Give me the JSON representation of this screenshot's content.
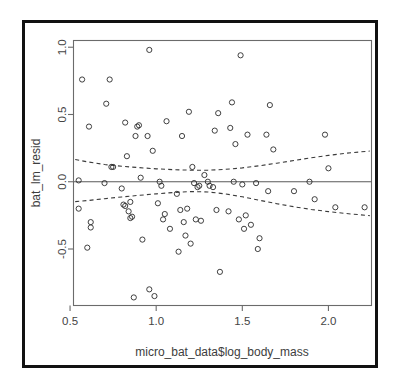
{
  "figure": {
    "border_color": "#111111",
    "background": "#ffffff",
    "axis_color": "#6b6b6b",
    "point_color": "#2b2b2b",
    "band_color": "#3a3a3a"
  },
  "chart_data": {
    "type": "scatter",
    "title": "",
    "xlabel": "micro_bat_data$log_body_mass",
    "ylabel": "bat_lm_resid",
    "xlim": [
      0.52,
      2.25
    ],
    "ylim": [
      -0.92,
      1.05
    ],
    "xticks": [
      0.5,
      1.0,
      1.5,
      2.0
    ],
    "xtick_labels": [
      "0.5",
      "1.0",
      "1.5",
      "2.0"
    ],
    "yticks": [
      -0.5,
      0.0,
      0.5,
      1.0
    ],
    "ytick_labels": [
      "-0.5",
      "0.0",
      "0.5",
      "1.0"
    ],
    "grid": false,
    "legend": null,
    "reference_lines": [
      {
        "name": "zero-line",
        "type": "horizontal",
        "y": 0.0,
        "style": "solid"
      }
    ],
    "annotations": [],
    "series": [
      {
        "name": "residuals",
        "type": "scatter",
        "marker": "open-circle",
        "points": [
          [
            0.55,
            0.01
          ],
          [
            0.55,
            -0.2
          ],
          [
            0.57,
            0.76
          ],
          [
            0.6,
            -0.49
          ],
          [
            0.61,
            0.41
          ],
          [
            0.62,
            -0.3
          ],
          [
            0.62,
            -0.34
          ],
          [
            0.7,
            -0.01
          ],
          [
            0.71,
            0.58
          ],
          [
            0.73,
            0.76
          ],
          [
            0.74,
            0.11
          ],
          [
            0.75,
            0.11
          ],
          [
            0.8,
            -0.05
          ],
          [
            0.81,
            -0.17
          ],
          [
            0.82,
            0.44
          ],
          [
            0.82,
            -0.18
          ],
          [
            0.83,
            0.19
          ],
          [
            0.84,
            -0.22
          ],
          [
            0.85,
            -0.15
          ],
          [
            0.85,
            -0.27
          ],
          [
            0.86,
            -0.26
          ],
          [
            0.87,
            -0.86
          ],
          [
            0.88,
            0.34
          ],
          [
            0.89,
            0.41
          ],
          [
            0.9,
            0.42
          ],
          [
            0.91,
            0.03
          ],
          [
            0.92,
            -0.43
          ],
          [
            0.95,
            0.34
          ],
          [
            0.96,
            0.98
          ],
          [
            0.96,
            -0.8
          ],
          [
            0.98,
            0.23
          ],
          [
            0.99,
            -0.85
          ],
          [
            1.01,
            -0.16
          ],
          [
            1.02,
            0.0
          ],
          [
            1.03,
            -0.03
          ],
          [
            1.04,
            -0.28
          ],
          [
            1.05,
            -0.24
          ],
          [
            1.06,
            0.45
          ],
          [
            1.08,
            -0.35
          ],
          [
            1.12,
            -0.09
          ],
          [
            1.13,
            -0.52
          ],
          [
            1.14,
            -0.21
          ],
          [
            1.15,
            0.34
          ],
          [
            1.16,
            -0.3
          ],
          [
            1.17,
            -0.4
          ],
          [
            1.18,
            -0.2
          ],
          [
            1.19,
            0.52
          ],
          [
            1.2,
            -0.46
          ],
          [
            1.21,
            0.11
          ],
          [
            1.22,
            -0.01
          ],
          [
            1.23,
            -0.28
          ],
          [
            1.24,
            -0.04
          ],
          [
            1.25,
            -0.03
          ],
          [
            1.26,
            -0.29
          ],
          [
            1.28,
            0.05
          ],
          [
            1.3,
            0.0
          ],
          [
            1.31,
            -0.03
          ],
          [
            1.33,
            -0.04
          ],
          [
            1.34,
            0.38
          ],
          [
            1.35,
            -0.21
          ],
          [
            1.36,
            0.51
          ],
          [
            1.37,
            -0.67
          ],
          [
            1.42,
            -0.22
          ],
          [
            1.43,
            0.4
          ],
          [
            1.44,
            0.59
          ],
          [
            1.45,
            0.0
          ],
          [
            1.46,
            0.28
          ],
          [
            1.48,
            -0.28
          ],
          [
            1.49,
            0.94
          ],
          [
            1.5,
            -0.02
          ],
          [
            1.51,
            -0.35
          ],
          [
            1.52,
            -0.25
          ],
          [
            1.53,
            0.35
          ],
          [
            1.55,
            -0.32
          ],
          [
            1.58,
            -0.01
          ],
          [
            1.59,
            -0.5
          ],
          [
            1.6,
            -0.42
          ],
          [
            1.64,
            0.35
          ],
          [
            1.65,
            -0.07
          ],
          [
            1.66,
            0.57
          ],
          [
            1.68,
            0.24
          ],
          [
            1.8,
            -0.07
          ],
          [
            1.89,
            0.0
          ],
          [
            1.92,
            -0.13
          ],
          [
            1.98,
            0.35
          ],
          [
            2.0,
            0.1
          ],
          [
            2.04,
            -0.19
          ],
          [
            2.21,
            -0.19
          ]
        ]
      },
      {
        "name": "upper-confidence-band",
        "type": "line",
        "style": "dashed",
        "points": [
          [
            0.53,
            0.165
          ],
          [
            0.6,
            0.148
          ],
          [
            0.7,
            0.128
          ],
          [
            0.8,
            0.115
          ],
          [
            0.9,
            0.105
          ],
          [
            1.0,
            0.096
          ],
          [
            1.1,
            0.09
          ],
          [
            1.2,
            0.086
          ],
          [
            1.3,
            0.086
          ],
          [
            1.4,
            0.092
          ],
          [
            1.5,
            0.103
          ],
          [
            1.6,
            0.119
          ],
          [
            1.7,
            0.138
          ],
          [
            1.8,
            0.158
          ],
          [
            1.9,
            0.178
          ],
          [
            2.0,
            0.196
          ],
          [
            2.1,
            0.212
          ],
          [
            2.24,
            0.228
          ]
        ]
      },
      {
        "name": "lower-confidence-band",
        "type": "line",
        "style": "dashed",
        "points": [
          [
            0.53,
            -0.148
          ],
          [
            0.6,
            -0.14
          ],
          [
            0.7,
            -0.126
          ],
          [
            0.8,
            -0.113
          ],
          [
            0.9,
            -0.101
          ],
          [
            1.0,
            -0.09
          ],
          [
            1.1,
            -0.08
          ],
          [
            1.2,
            -0.073
          ],
          [
            1.3,
            -0.076
          ],
          [
            1.4,
            -0.09
          ],
          [
            1.5,
            -0.112
          ],
          [
            1.6,
            -0.138
          ],
          [
            1.7,
            -0.163
          ],
          [
            1.8,
            -0.186
          ],
          [
            1.9,
            -0.206
          ],
          [
            2.0,
            -0.222
          ],
          [
            2.1,
            -0.236
          ],
          [
            2.24,
            -0.252
          ]
        ]
      }
    ]
  }
}
